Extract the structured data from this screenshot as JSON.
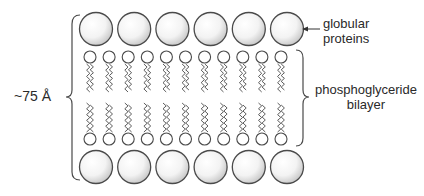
{
  "labels": {
    "thickness": "~75 Å",
    "globular_proteins_line1": "globular",
    "globular_proteins_line2": "proteins",
    "bilayer_line1": "phosphoglyceride",
    "bilayer_line2": "bilayer"
  },
  "structure": {
    "protein_count_per_side": 6,
    "lipid_heads_per_leaflet": 11,
    "layers": [
      "top globular proteins",
      "outer lipid leaflet",
      "inner lipid leaflet",
      "bottom globular proteins"
    ]
  },
  "colors": {
    "stroke": "#4a4a4a",
    "text": "#2a2a2a",
    "protein_fill_light": "#ffffff",
    "protein_fill_dark": "#c8c8c8"
  }
}
